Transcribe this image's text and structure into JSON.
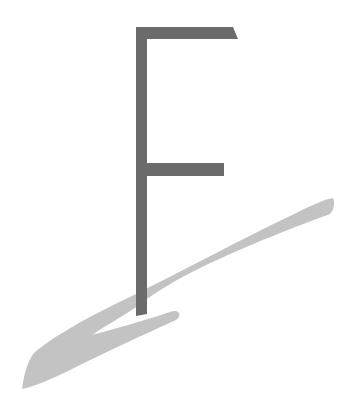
{
  "logo": {
    "letter": "F",
    "letter_color": "#6b6b6b",
    "swoosh_color": "#c3c3c3",
    "background": "#ffffff"
  }
}
